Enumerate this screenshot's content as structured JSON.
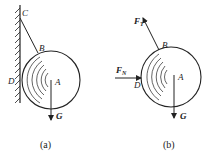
{
  "figure_a": {
    "caption": "(a)",
    "points": {
      "C": "C",
      "B": "B",
      "D": "D",
      "A": "A"
    },
    "weight_label": "G"
  },
  "figure_b": {
    "caption": "(b)",
    "points": {
      "B": "B",
      "D": "D",
      "A": "A"
    },
    "tension_label": "F",
    "tension_sub": "T",
    "normal_label": "F",
    "normal_sub": "N",
    "weight_label": "G"
  },
  "colors": {
    "ink": "#222222",
    "background": "#ffffff"
  }
}
